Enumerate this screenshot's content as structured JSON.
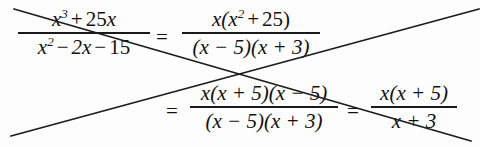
{
  "document": {
    "kind": "scanned-math-worksheet",
    "background_color": "#fdfdfd",
    "ink_color": "#111111",
    "width": 480,
    "height": 147
  },
  "equation": {
    "description": "Simplification of a rational expression, shown as a chain of equalities across two lines.",
    "line1": {
      "fraction1": {
        "numerator": "x³ + 25x",
        "denominator": "x² − 2x − 15",
        "numerator_parts": {
          "base1": "x",
          "exp1": "3",
          "plus": "+",
          "coef": "25",
          "var": "x"
        },
        "denominator_parts": {
          "base1": "x",
          "exp1": "2",
          "minus1": "−",
          "term2": "2x",
          "minus2": "−",
          "term3": "15"
        }
      },
      "equals1": "=",
      "fraction2": {
        "numerator": "x(x² + 25)",
        "denominator": "(x − 5)(x + 3)",
        "numerator_parts": {
          "lead": "x(",
          "base": "x",
          "exp": "2",
          "plus": "+",
          "const": "25",
          "close": ")"
        },
        "denominator_parts": {
          "factor1": "(x − 5)",
          "factor2": "(x + 3)"
        }
      }
    },
    "line2": {
      "equals2": "=",
      "fraction3": {
        "numerator": "x(x + 5)(x − 5)",
        "denominator": "(x − 5)(x + 3)"
      },
      "equals3": "=",
      "fraction4": {
        "numerator": "x(x + 5)",
        "denominator": "x + 3"
      }
    }
  },
  "annotations": {
    "strokes": [
      {
        "name": "descending-pen-stroke",
        "x1": 14,
        "y1": 9,
        "x2": 471,
        "y2": 141,
        "color": "#1c1c1c",
        "width": 1.8
      },
      {
        "name": "ascending-pen-stroke",
        "x1": 11,
        "y1": 136,
        "x2": 479,
        "y2": 9,
        "color": "#1c1c1c",
        "width": 1.8
      }
    ],
    "crossing_point": {
      "x": 248,
      "y": 80
    }
  }
}
